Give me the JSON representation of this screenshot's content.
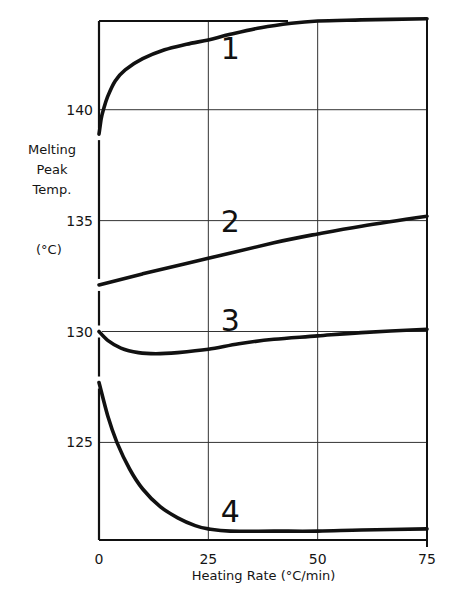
{
  "chart_data": {
    "type": "line",
    "title": "",
    "xlabel": "Heating Rate (°C/min)",
    "ylabel_lines": [
      "Melting",
      "Peak",
      "Temp."
    ],
    "ylabel_unit": "(°C)",
    "xlim": [
      0,
      75
    ],
    "ylim": [
      120.6,
      144.0
    ],
    "x_ticks": [
      0,
      25,
      50,
      75
    ],
    "x_tick_labels": [
      "0",
      "25",
      "50",
      "75"
    ],
    "y_ticks": [
      125,
      130,
      135,
      140
    ],
    "y_tick_labels": [
      "125",
      "130",
      "135",
      "140"
    ],
    "grid": true,
    "legend": "none (curves labeled inline with numbers 1–4)",
    "series": [
      {
        "name": "1",
        "label_pos": [
          30,
          142.8
        ],
        "x": [
          0,
          0.5,
          1,
          2,
          3.7,
          6,
          10,
          15,
          20,
          25,
          30,
          37,
          44,
          50,
          60,
          75
        ],
        "y": [
          138.9,
          139.6,
          140.0,
          140.6,
          141.3,
          141.8,
          142.3,
          142.7,
          142.95,
          143.15,
          143.4,
          143.7,
          143.9,
          144.0,
          144.05,
          144.1
        ]
      },
      {
        "name": "2",
        "label_pos": [
          30,
          135.0
        ],
        "x": [
          0,
          10,
          25,
          40,
          50,
          60,
          75
        ],
        "y": [
          132.1,
          132.6,
          133.3,
          134.0,
          134.4,
          134.75,
          135.2
        ]
      },
      {
        "name": "3",
        "label_pos": [
          30,
          130.5
        ],
        "x": [
          0,
          2,
          5,
          9,
          13,
          18,
          25,
          32,
          40,
          50,
          60,
          75
        ],
        "y": [
          130.0,
          129.6,
          129.25,
          129.05,
          129.0,
          129.05,
          129.2,
          129.45,
          129.65,
          129.8,
          129.95,
          130.1
        ]
      },
      {
        "name": "4",
        "label_pos": [
          30,
          121.9
        ],
        "x": [
          0,
          2,
          4.1,
          7,
          10,
          14,
          18,
          22,
          25,
          30,
          40,
          50,
          60,
          75
        ],
        "y": [
          127.7,
          126.2,
          125.0,
          123.8,
          122.9,
          122.1,
          121.6,
          121.25,
          121.1,
          121.0,
          121.0,
          121.0,
          121.05,
          121.1
        ]
      }
    ]
  }
}
